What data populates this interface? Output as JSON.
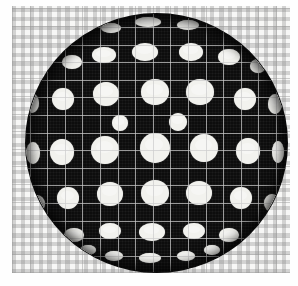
{
  "figure": {
    "caption": "",
    "media": "halftone scan",
    "colors": {
      "sphere_fill": "#0d0d0d",
      "dot_fill": "#f2f2ee",
      "grid_line": "#cdcdcd",
      "paper_background": "#f7f7f6",
      "checker_ink": "#787878"
    }
  },
  "background": {
    "name": "checkered-grid-paper",
    "left": 12,
    "top": 6,
    "width": 278,
    "height": 267,
    "grid_cell_px": 17.6,
    "checker_cell_px": 9
  },
  "sphere": {
    "name": "dark-sphere",
    "center_x": 156,
    "center_y": 143,
    "radius_x": 130,
    "radius_y": 129,
    "fill": "#0d0d0d",
    "dot_count": 64
  },
  "chart_data": {
    "type": "scatter",
    "xlabel": "",
    "ylabel": "",
    "xlim": [
      0,
      298
    ],
    "ylim": [
      0,
      286
    ],
    "grid": true,
    "legend": "none",
    "series": [
      {
        "name": "dots",
        "points": [
          {
            "x": 148,
            "y": 22,
            "rx": 13,
            "ry": 5
          },
          {
            "x": 188,
            "y": 25,
            "rx": 11,
            "ry": 5
          },
          {
            "x": 111,
            "y": 28,
            "rx": 10,
            "ry": 5
          },
          {
            "x": 145,
            "y": 52,
            "rx": 13,
            "ry": 9
          },
          {
            "x": 104,
            "y": 55,
            "rx": 12,
            "ry": 8
          },
          {
            "x": 191,
            "y": 52,
            "rx": 12,
            "ry": 9
          },
          {
            "x": 229,
            "y": 57,
            "rx": 11,
            "ry": 8
          },
          {
            "x": 72,
            "y": 62,
            "rx": 10,
            "ry": 7
          },
          {
            "x": 258,
            "y": 66,
            "rx": 8,
            "ry": 7
          },
          {
            "x": 155,
            "y": 92,
            "rx": 14,
            "ry": 13
          },
          {
            "x": 106,
            "y": 94,
            "rx": 13,
            "ry": 12
          },
          {
            "x": 200,
            "y": 92,
            "rx": 14,
            "ry": 13
          },
          {
            "x": 63,
            "y": 99,
            "rx": 11,
            "ry": 11
          },
          {
            "x": 245,
            "y": 99,
            "rx": 11,
            "ry": 11
          },
          {
            "x": 32,
            "y": 103,
            "rx": 7,
            "ry": 10
          },
          {
            "x": 275,
            "y": 104,
            "rx": 7,
            "ry": 10
          },
          {
            "x": 178,
            "y": 122,
            "rx": 9,
            "ry": 9
          },
          {
            "x": 120,
            "y": 123,
            "rx": 8,
            "ry": 8
          },
          {
            "x": 155,
            "y": 148,
            "rx": 15,
            "ry": 15
          },
          {
            "x": 105,
            "y": 150,
            "rx": 14,
            "ry": 14
          },
          {
            "x": 204,
            "y": 148,
            "rx": 14,
            "ry": 14
          },
          {
            "x": 62,
            "y": 152,
            "rx": 12,
            "ry": 13
          },
          {
            "x": 248,
            "y": 151,
            "rx": 12,
            "ry": 13
          },
          {
            "x": 33,
            "y": 153,
            "rx": 7,
            "ry": 11
          },
          {
            "x": 278,
            "y": 152,
            "rx": 6,
            "ry": 11
          },
          {
            "x": 155,
            "y": 193,
            "rx": 14,
            "ry": 13
          },
          {
            "x": 110,
            "y": 194,
            "rx": 13,
            "ry": 12
          },
          {
            "x": 199,
            "y": 193,
            "rx": 13,
            "ry": 12
          },
          {
            "x": 68,
            "y": 198,
            "rx": 11,
            "ry": 11
          },
          {
            "x": 241,
            "y": 198,
            "rx": 11,
            "ry": 11
          },
          {
            "x": 37,
            "y": 204,
            "rx": 8,
            "ry": 9
          },
          {
            "x": 272,
            "y": 203,
            "rx": 8,
            "ry": 9
          },
          {
            "x": 152,
            "y": 232,
            "rx": 13,
            "ry": 9
          },
          {
            "x": 110,
            "y": 231,
            "rx": 11,
            "ry": 8
          },
          {
            "x": 194,
            "y": 231,
            "rx": 11,
            "ry": 8
          },
          {
            "x": 74,
            "y": 235,
            "rx": 10,
            "ry": 7
          },
          {
            "x": 229,
            "y": 235,
            "rx": 10,
            "ry": 7
          },
          {
            "x": 48,
            "y": 242,
            "rx": 8,
            "ry": 6
          },
          {
            "x": 257,
            "y": 242,
            "rx": 8,
            "ry": 6
          },
          {
            "x": 150,
            "y": 258,
            "rx": 11,
            "ry": 5
          },
          {
            "x": 114,
            "y": 256,
            "rx": 9,
            "ry": 5
          },
          {
            "x": 186,
            "y": 256,
            "rx": 9,
            "ry": 5
          },
          {
            "x": 88,
            "y": 250,
            "rx": 8,
            "ry": 5
          },
          {
            "x": 212,
            "y": 250,
            "rx": 8,
            "ry": 5
          }
        ]
      }
    ]
  }
}
